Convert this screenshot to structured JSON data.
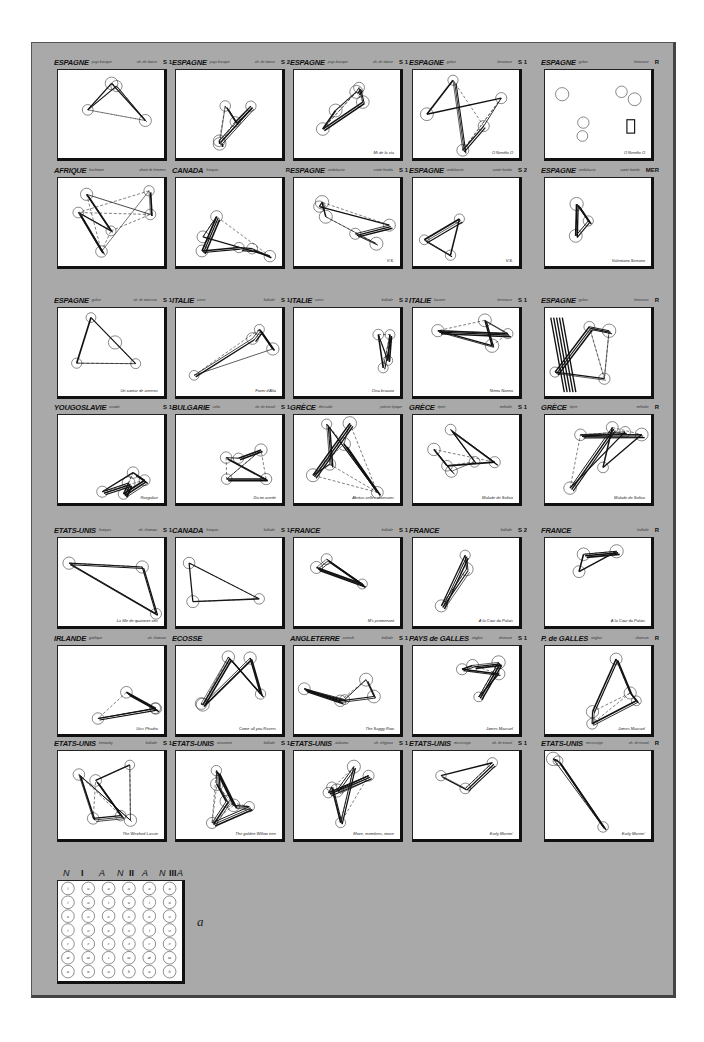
{
  "figure": {
    "background_color": "#a9a9a9",
    "panel_color": "#ffffff",
    "ink_color": "#111111",
    "legend_label": "a"
  },
  "rows": [
    [
      {
        "country": "ESPAGNE",
        "region": "pays basque",
        "genre": "ch. de danse",
        "code": "S 1",
        "caption": ""
      },
      {
        "country": "ESPAGNE",
        "region": "pays basque",
        "genre": "ch. de danse",
        "code": "S 2",
        "caption": ""
      },
      {
        "country": "ESPAGNE",
        "region": "pays basque",
        "genre": "ch. de danse",
        "code": "S 1",
        "caption": "Mi de la vía"
      },
      {
        "country": "ESPAGNE",
        "region": "galice",
        "genre": "berceuse",
        "code": "S 1",
        "caption": "O Neniño O"
      },
      {
        "country": "ESPAGNE",
        "region": "galice",
        "genre": "berceuse",
        "code": "R",
        "caption": "O Neniño O"
      }
    ],
    [
      {
        "country": "AFRIQUE",
        "region": "bushman",
        "genre": "chant de femmes",
        "code": "",
        "caption": ""
      },
      {
        "country": "CANADA",
        "region": "français",
        "genre": "",
        "code": "R",
        "caption": ""
      },
      {
        "country": "ESPAGNE",
        "region": "andalousie",
        "genre": "cante hondo",
        "code": "S 1",
        "caption": "V.S."
      },
      {
        "country": "ESPAGNE",
        "region": "andalousie",
        "genre": "cante hondo",
        "code": "S 2",
        "caption": "V.S."
      },
      {
        "country": "ESPAGNE",
        "region": "andalousie",
        "genre": "cante hondo",
        "code": "MER",
        "caption": "Valentano Serrano"
      }
    ],
    [
      {
        "country": "ESPAGNE",
        "region": "galice",
        "genre": "ch. de moisson",
        "code": "S 1",
        "caption": "Un cantar de arrieros"
      },
      {
        "country": "ITALIE",
        "region": "corse",
        "genre": "ballade",
        "code": "S 1",
        "caption": "Fiorni d'Alia"
      },
      {
        "country": "ITALIE",
        "region": "corse",
        "genre": "ballade",
        "code": "S 2",
        "caption": "Oisu braccio"
      },
      {
        "country": "ITALIE",
        "region": "lucanie",
        "genre": "berceuse",
        "code": "S 1",
        "caption": "Ninna Nanna"
      },
      {
        "country": "ESPAGNE",
        "region": "galice",
        "genre": "berceuse",
        "code": "R",
        "caption": ""
      }
    ],
    [
      {
        "country": "YOUGOSLAVIE",
        "region": "croatie",
        "genre": "",
        "code": "S 1",
        "caption": "Rozgalice"
      },
      {
        "country": "BULGARIE",
        "region": "sofia",
        "genre": "ch. de travail",
        "code": "S 1",
        "caption": "Da mi avede"
      },
      {
        "country": "GRÈCE",
        "region": "thessalie",
        "genre": "poésie épique",
        "code": "",
        "caption": "Akritas celles chansons"
      },
      {
        "country": "GRÈCE",
        "region": "épire",
        "genre": "mélodie",
        "code": "S 1",
        "caption": "Malade de Sofico"
      },
      {
        "country": "GRÈCE",
        "region": "épire",
        "genre": "mélodie",
        "code": "R",
        "caption": "Malade de Sofico"
      }
    ],
    [
      {
        "country": "ETATS-UNIS",
        "region": "français",
        "genre": "ch. d'amour",
        "code": "S 1",
        "caption": "La fille de quatorze ans"
      },
      {
        "country": "CANADA",
        "region": "français",
        "genre": "ballade",
        "code": "S 1",
        "caption": ""
      },
      {
        "country": "FRANCE",
        "region": "",
        "genre": "ballade",
        "code": "S 1",
        "caption": "M's promenant"
      },
      {
        "country": "FRANCE",
        "region": "",
        "genre": "ballade",
        "code": "S 2",
        "caption": "À la Cour du Palais"
      },
      {
        "country": "FRANCE",
        "region": "",
        "genre": "ballade",
        "code": "R",
        "caption": "À la Cour du Palais"
      }
    ],
    [
      {
        "country": "IRLANDE",
        "region": "gaélique",
        "genre": "ch. d'amour",
        "code": "",
        "caption": "Uiss Phadru"
      },
      {
        "country": "ECOSSE",
        "region": "",
        "genre": "",
        "code": "",
        "caption": "Come all you Rovers"
      },
      {
        "country": "ANGLETERRE",
        "region": "cornish",
        "genre": "ballade",
        "code": "S 1",
        "caption": "The Saggy Row"
      },
      {
        "country": "PAYS de GALLES",
        "region": "anglais",
        "genre": "chanson",
        "code": "S 1",
        "caption": "James Macrael"
      },
      {
        "country": "P. de GALLES",
        "region": "anglais",
        "genre": "chanson",
        "code": "R",
        "caption": "James Macrael"
      }
    ],
    [
      {
        "country": "ETATS-UNIS",
        "region": "kentucky",
        "genre": "ballade",
        "code": "S 1",
        "caption": "The Wexford Lassie"
      },
      {
        "country": "ETATS-UNIS",
        "region": "wisconsin",
        "genre": "ballade",
        "code": "S 1",
        "caption": "The golden Willow tree"
      },
      {
        "country": "ETATS-UNIS",
        "region": "alabama",
        "genre": "ch. religieux",
        "code": "S 1",
        "caption": "Move, members, move"
      },
      {
        "country": "ETATS-UNIS",
        "region": "mississippi",
        "genre": "ch. de travail",
        "code": "S 1",
        "caption": "Early Mornin'"
      },
      {
        "country": "ETATS-UNIS",
        "region": "mississippi",
        "genre": "ch. de travail",
        "code": "R",
        "caption": "Early Mornin'"
      }
    ]
  ],
  "legend": {
    "headers": [
      "N",
      "I",
      "A",
      "N",
      "II",
      "A",
      "N",
      "III",
      "A"
    ],
    "columns": [
      {
        "group": "I",
        "type": "N",
        "cells": [
          "i",
          "i",
          "e",
          "i",
          "ɛ",
          "æ",
          "a"
        ]
      },
      {
        "group": "I",
        "type": "A",
        "cells": [
          "u",
          "u",
          "o",
          "o",
          "ɔ",
          "ɯ",
          "ɒ"
        ]
      },
      {
        "group": "II",
        "type": "N",
        "cells": [
          "a",
          "i",
          "e",
          "e",
          "ɛ",
          "ɪ",
          "a"
        ]
      },
      {
        "group": "II",
        "type": "A",
        "cells": [
          "u",
          "u",
          "o",
          "o",
          "ɔ",
          "ɯ",
          "h"
        ]
      },
      {
        "group": "III",
        "type": "N",
        "cells": [
          "a",
          "i",
          "e",
          "i",
          "ɛ",
          "æ",
          "a"
        ]
      },
      {
        "group": "III",
        "type": "A",
        "cells": [
          "u",
          "u",
          "o",
          "o",
          "ɔ",
          "ɯ",
          "h"
        ]
      }
    ]
  }
}
